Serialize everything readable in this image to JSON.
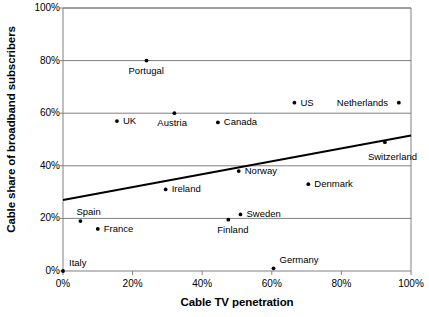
{
  "chart_data": {
    "type": "scatter",
    "title": "",
    "xlabel": "Cable TV penetration",
    "ylabel": "Cable share of broadband subscribers",
    "xlim": [
      0,
      100
    ],
    "ylim": [
      0,
      100
    ],
    "grid": "horizontal",
    "legend": "none",
    "xticks": [
      "0%",
      "20%",
      "40%",
      "60%",
      "80%",
      "100%"
    ],
    "xtick_values": [
      0,
      20,
      40,
      60,
      80,
      100
    ],
    "yticks": [
      "0%",
      "20%",
      "40%",
      "60%",
      "80%",
      "100%"
    ],
    "ytick_values": [
      0,
      20,
      40,
      60,
      80,
      100
    ],
    "points": [
      {
        "name": "Italy",
        "x": 0,
        "y": 0,
        "label_dx": 6,
        "label_dy": -13
      },
      {
        "name": "Spain",
        "x": 5,
        "y": 19,
        "label_dx": -4,
        "label_dy": -14
      },
      {
        "name": "France",
        "x": 10,
        "y": 16,
        "label_dx": 6,
        "label_dy": -5
      },
      {
        "name": "UK",
        "x": 15.5,
        "y": 57,
        "label_dx": 6,
        "label_dy": -5
      },
      {
        "name": "Portugal",
        "x": 24,
        "y": 80,
        "label_dx": -18,
        "label_dy": 5
      },
      {
        "name": "Ireland",
        "x": 29.5,
        "y": 31,
        "label_dx": 6,
        "label_dy": -5
      },
      {
        "name": "Austria",
        "x": 32,
        "y": 60,
        "label_dx": -17,
        "label_dy": 5
      },
      {
        "name": "Canada",
        "x": 44.5,
        "y": 56.5,
        "label_dx": 6,
        "label_dy": -5
      },
      {
        "name": "Finland",
        "x": 47.5,
        "y": 19.5,
        "label_dx": -11,
        "label_dy": 5
      },
      {
        "name": "Sweden",
        "x": 51,
        "y": 21.5,
        "label_dx": 6,
        "label_dy": -5
      },
      {
        "name": "Norway",
        "x": 50.5,
        "y": 38,
        "label_dx": 6,
        "label_dy": -5
      },
      {
        "name": "Germany",
        "x": 60.5,
        "y": 1,
        "label_dx": 6,
        "label_dy": -13
      },
      {
        "name": "US",
        "x": 66.5,
        "y": 64,
        "label_dx": 6,
        "label_dy": -5
      },
      {
        "name": "Denmark",
        "x": 70.5,
        "y": 33,
        "label_dx": 6,
        "label_dy": -5
      },
      {
        "name": "Switzerland",
        "x": 92.5,
        "y": 49,
        "label_dx": -17,
        "label_dy": 10
      },
      {
        "name": "Netherlands",
        "x": 96.5,
        "y": 64,
        "label_dx": -62,
        "label_dy": -5
      }
    ],
    "trendline": {
      "name": "linear-trend",
      "x0": 0,
      "y0": 27,
      "x1": 100,
      "y1": 51.5
    },
    "colors": {
      "marker": "#000000",
      "trendline": "#000000",
      "gridline": "#808080",
      "frame": "#808080",
      "text": "#000000",
      "background": "#ffffff"
    }
  }
}
